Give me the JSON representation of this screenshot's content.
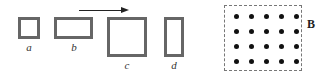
{
  "figure": {
    "loops": [
      {
        "id": "a",
        "label": "a",
        "x": 18,
        "y": 17,
        "w": 22,
        "h": 22,
        "label_x": 19,
        "label_y": 41
      },
      {
        "id": "b",
        "label": "b",
        "x": 54,
        "y": 17,
        "w": 39,
        "h": 22,
        "label_x": 64,
        "label_y": 41
      },
      {
        "id": "c",
        "label": "c",
        "x": 107,
        "y": 17,
        "w": 40,
        "h": 40,
        "label_x": 117,
        "label_y": 59
      },
      {
        "id": "d",
        "label": "d",
        "x": 164,
        "y": 17,
        "w": 20,
        "h": 40,
        "label_x": 164,
        "label_y": 59
      }
    ],
    "motion_arrow": {
      "direction": "right",
      "x1": 79,
      "x2": 128,
      "y": 10
    },
    "magnetic_field": {
      "label": "B",
      "direction": "out-of-page",
      "rows": 4,
      "cols": 5,
      "box": {
        "x": 224,
        "y": 5,
        "w": 78,
        "h": 66
      }
    }
  }
}
